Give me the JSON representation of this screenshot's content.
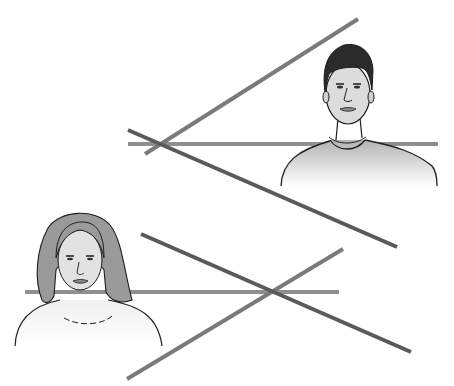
{
  "illustration": {
    "colors": {
      "background": "#ffffff",
      "line_light": "#8c8c8c",
      "line_dark": "#595959",
      "outline": "#1e1e1e",
      "skin": "#e6e6e6",
      "hair_dark": "#2b2b2b",
      "hair_light": "#9a9a9a",
      "shirt_top": "#bdbdbd"
    },
    "figures": [
      {
        "name": "man",
        "position": "top-right"
      },
      {
        "name": "woman",
        "position": "bottom-left"
      }
    ],
    "line_groups": [
      {
        "name": "upper-lines",
        "lines": [
          {
            "x1": 128,
            "y1": 144,
            "x2": 438,
            "y2": 144,
            "shade": "light"
          },
          {
            "x1": 145,
            "y1": 154,
            "x2": 358,
            "y2": 19,
            "shade": "medium"
          },
          {
            "x1": 128,
            "y1": 130,
            "x2": 397,
            "y2": 247,
            "shade": "dark"
          }
        ]
      },
      {
        "name": "lower-lines",
        "lines": [
          {
            "x1": 25,
            "y1": 292,
            "x2": 339,
            "y2": 292,
            "shade": "light"
          },
          {
            "x1": 127,
            "y1": 379,
            "x2": 343,
            "y2": 249,
            "shade": "medium"
          },
          {
            "x1": 141,
            "y1": 234,
            "x2": 411,
            "y2": 352,
            "shade": "dark"
          }
        ]
      }
    ]
  }
}
